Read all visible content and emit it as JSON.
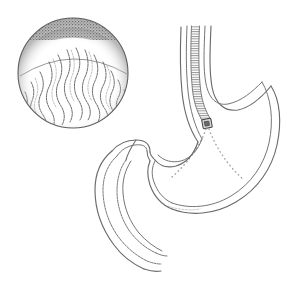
{
  "figure": {
    "caption": "",
    "width": 287,
    "height": 287,
    "background_color": "#ffffff",
    "line_color": "#6b6b6b",
    "line_color_dark": "#4a4a4a",
    "stipple_color": "#3c3c3c",
    "dotted_color": "#9a9a9a",
    "style": "grayscale pen-and-ink line drawing"
  },
  "panels": [
    {
      "id": "endoscopic-view",
      "name": "endoscopic-view-circle",
      "description": "Circular endoscopic photograph view of the gastric mucosa showing longitudinal rugal folds with a dark shaded crescent along the upper rim",
      "center_x": 73,
      "center_y": 73,
      "radius": 55,
      "features": [
        "circular border",
        "dark stippled crescent shading upper rim",
        "vertical wavy rugal folds",
        "light stipple lower rim"
      ],
      "fold_count": 13
    },
    {
      "id": "anatomy-view",
      "name": "stomach-anatomy-cross-section",
      "description": "Sagittal line drawing of the distal esophagus, stomach and duodenum with a flexible endoscope passed down the esophagus; dotted lines indicate the field of view from the scope tip",
      "parts": [
        {
          "id": "esophagus",
          "label": "Esophagus"
        },
        {
          "id": "endoscope",
          "label": "Endoscope"
        },
        {
          "id": "endoscope-tip",
          "label": "Endoscope camera tip"
        },
        {
          "id": "fundus",
          "label": "Gastric fundus"
        },
        {
          "id": "body",
          "label": "Gastric body"
        },
        {
          "id": "greater-curvature",
          "label": "Greater curvature"
        },
        {
          "id": "lesser-curvature",
          "label": "Lesser curvature"
        },
        {
          "id": "antrum",
          "label": "Antrum"
        },
        {
          "id": "pylorus",
          "label": "Pylorus"
        },
        {
          "id": "duodenum",
          "label": "Duodenum"
        },
        {
          "id": "view-cone",
          "label": "Field of view"
        }
      ]
    }
  ]
}
